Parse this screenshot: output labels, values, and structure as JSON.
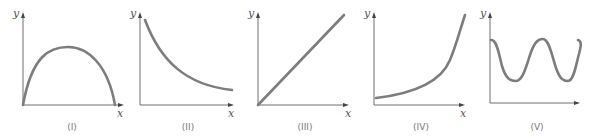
{
  "figure": {
    "graphs": [
      {
        "id": "I",
        "caption": "(I)",
        "x_label": "x",
        "y_label": "y",
        "shape": "inverted-parabola"
      },
      {
        "id": "II",
        "caption": "(II)",
        "x_label": "x",
        "y_label": "y",
        "shape": "decreasing-decay"
      },
      {
        "id": "III",
        "caption": "(III)",
        "x_label": "x",
        "y_label": "y",
        "shape": "linear-through-origin"
      },
      {
        "id": "IV",
        "caption": "(IV)",
        "x_label": "x",
        "y_label": "y",
        "shape": "increasing-exponential"
      },
      {
        "id": "V",
        "caption": "(V)",
        "x_label": "",
        "y_label": "y",
        "shape": "oscillating-wave"
      }
    ],
    "colors": {
      "curve": "#7d7d7d",
      "axis": "#6e6e6e",
      "text": "#555555"
    }
  }
}
